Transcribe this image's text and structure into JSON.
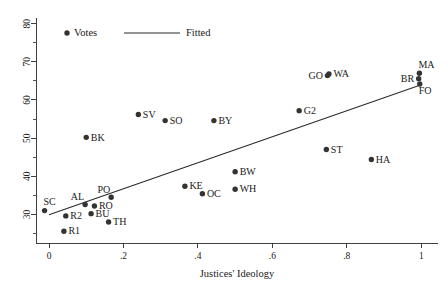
{
  "chart_data": {
    "type": "scatter",
    "title": "",
    "xlabel": "Justices' Ideology",
    "ylabel": "",
    "xlim": [
      -0.035,
      1.045
    ],
    "ylim": [
      22.5,
      81.5
    ],
    "grid": false,
    "legend_position": "top-left",
    "x_ticks": [
      "0",
      ".2",
      ".4",
      ".6",
      ".8",
      "1"
    ],
    "x_tick_values": [
      0,
      0.2,
      0.4,
      0.6,
      0.8,
      1
    ],
    "y_ticks": [
      "30",
      "40",
      "50",
      "60",
      "70",
      "80"
    ],
    "y_tick_values": [
      30,
      40,
      50,
      60,
      70,
      80
    ],
    "legend": [
      {
        "label": "Votes",
        "marker": "dot"
      },
      {
        "label": "Fitted",
        "marker": "line"
      }
    ],
    "series": [
      {
        "name": "Votes",
        "marker": "dot",
        "points": [
          {
            "label": "SC",
            "x": -0.012,
            "y": 31.0,
            "label_pos": "right-up"
          },
          {
            "label": "R1",
            "x": 0.04,
            "y": 25.6,
            "label_pos": "right"
          },
          {
            "label": "R2",
            "x": 0.045,
            "y": 29.6,
            "label_pos": "right"
          },
          {
            "label": "AL",
            "x": 0.097,
            "y": 32.6,
            "label_pos": "left-up"
          },
          {
            "label": "BK",
            "x": 0.1,
            "y": 50.2,
            "label_pos": "right"
          },
          {
            "label": "BU",
            "x": 0.113,
            "y": 30.2,
            "label_pos": "right"
          },
          {
            "label": "RO",
            "x": 0.122,
            "y": 32.2,
            "label_pos": "right"
          },
          {
            "label": "TH",
            "x": 0.16,
            "y": 28.0,
            "label_pos": "right"
          },
          {
            "label": "PO",
            "x": 0.167,
            "y": 34.5,
            "label_pos": "left-up"
          },
          {
            "label": "SV",
            "x": 0.24,
            "y": 56.2,
            "label_pos": "right"
          },
          {
            "label": "SO",
            "x": 0.312,
            "y": 54.6,
            "label_pos": "right"
          },
          {
            "label": "KE",
            "x": 0.365,
            "y": 37.4,
            "label_pos": "right"
          },
          {
            "label": "OC",
            "x": 0.412,
            "y": 35.4,
            "label_pos": "right"
          },
          {
            "label": "BY",
            "x": 0.443,
            "y": 54.6,
            "label_pos": "right"
          },
          {
            "label": "BW",
            "x": 0.5,
            "y": 41.2,
            "label_pos": "right"
          },
          {
            "label": "WH",
            "x": 0.5,
            "y": 36.6,
            "label_pos": "right"
          },
          {
            "label": "G2",
            "x": 0.672,
            "y": 57.2,
            "label_pos": "right"
          },
          {
            "label": "GO",
            "x": 0.748,
            "y": 66.4,
            "label_pos": "left"
          },
          {
            "label": "WA",
            "x": 0.752,
            "y": 66.8,
            "label_pos": "right"
          },
          {
            "label": "ST",
            "x": 0.745,
            "y": 47.0,
            "label_pos": "right"
          },
          {
            "label": "HA",
            "x": 0.866,
            "y": 44.4,
            "label_pos": "right"
          },
          {
            "label": "MA",
            "x": 0.995,
            "y": 67.0,
            "label_pos": "right-up"
          },
          {
            "label": "BR",
            "x": 0.993,
            "y": 65.6,
            "label_pos": "left"
          },
          {
            "label": "FO",
            "x": 0.996,
            "y": 64.2,
            "label_pos": "right-down"
          }
        ]
      }
    ],
    "fit_line": {
      "name": "Fitted",
      "x_start": 0.0,
      "y_start": 29.9,
      "x_end": 1.0,
      "y_end": 64.0
    }
  }
}
